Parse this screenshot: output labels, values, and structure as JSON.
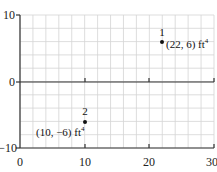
{
  "chart_data": {
    "type": "scatter",
    "title": "",
    "xlabel": "",
    "ylabel": "",
    "xlim": [
      0,
      30
    ],
    "ylim": [
      -10,
      10
    ],
    "x_ticks": [
      "0",
      "10",
      "20",
      "30"
    ],
    "y_ticks": [
      "10",
      "0",
      "-10"
    ],
    "grid": true,
    "grid_step_x": 2,
    "grid_step_y": 2,
    "points": [
      {
        "id": "1",
        "x": 22,
        "y": 6,
        "label": "(22, 6) ft",
        "unit_exp": "4"
      },
      {
        "id": "2",
        "x": 10,
        "y": -6,
        "label": "(10, −6) ft",
        "unit_exp": "4"
      }
    ]
  },
  "axes": {
    "x_tick_labels": [
      "0",
      "10",
      "20",
      "30"
    ],
    "y_tick_labels": [
      "10",
      "0",
      "−10"
    ]
  },
  "points": [
    {
      "id": "1",
      "label": "(22, 6) ft",
      "exp": "4"
    },
    {
      "id": "2",
      "label": "(10, −6) ft",
      "exp": "4"
    }
  ]
}
